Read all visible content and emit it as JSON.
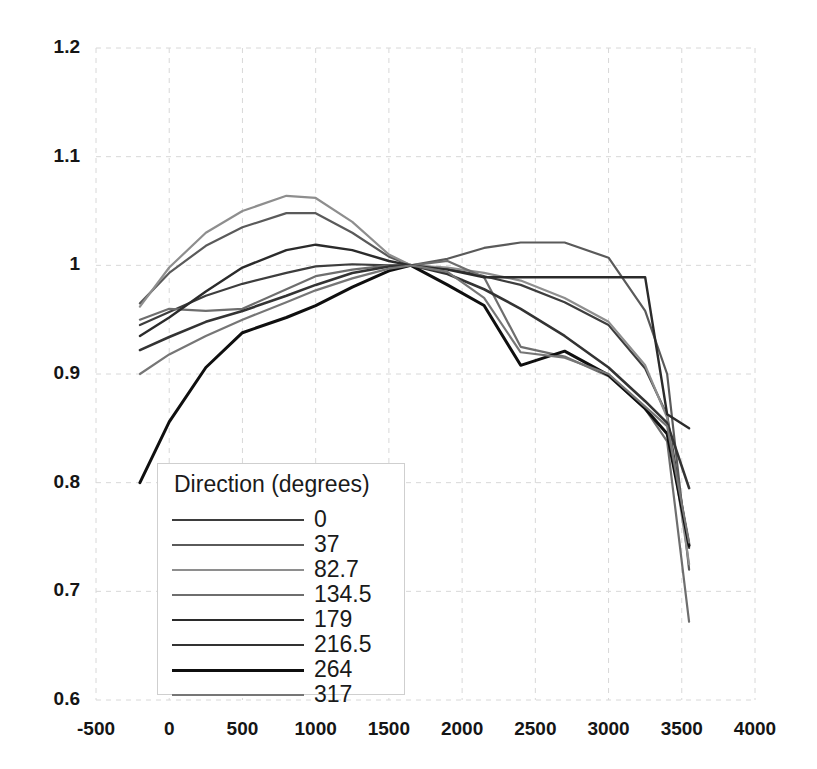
{
  "chart_data": {
    "type": "line",
    "title": "",
    "xlabel": "",
    "ylabel": "",
    "xlim": [
      -500,
      4000
    ],
    "ylim": [
      0.6,
      1.2
    ],
    "xticks": [
      "-500",
      "0",
      "500",
      "1000",
      "1500",
      "2000",
      "2500",
      "3000",
      "3500",
      "4000"
    ],
    "yticks": [
      "1.2",
      "1.1",
      "1",
      "0.9",
      "0.8",
      "0.7",
      "0.6"
    ],
    "grid": true,
    "legend_position": "lower-left",
    "legend_title": "Direction (degrees)",
    "series": [
      {
        "name": "0",
        "color": "#3d3d3d",
        "width": 2.2,
        "x": [
          -200,
          0,
          250,
          500,
          800,
          1000,
          1250,
          1500,
          1650,
          1900,
          2150,
          2400,
          2700,
          3000,
          3250,
          3400,
          3550
        ],
        "y": [
          0.945,
          0.957,
          0.972,
          0.983,
          0.993,
          0.999,
          1.001,
          1.0,
          1.0,
          0.997,
          0.99,
          0.982,
          0.966,
          0.945,
          0.905,
          0.862,
          0.74
        ]
      },
      {
        "name": "37",
        "color": "#5a5a5a",
        "width": 2.2,
        "x": [
          -200,
          0,
          250,
          500,
          800,
          1000,
          1250,
          1500,
          1650,
          1900,
          2150,
          2400,
          2700,
          3000,
          3250,
          3400,
          3550
        ],
        "y": [
          0.965,
          0.993,
          1.018,
          1.035,
          1.048,
          1.048,
          1.03,
          1.008,
          1.0,
          1.006,
          1.016,
          1.021,
          1.021,
          1.007,
          0.958,
          0.9,
          0.72
        ]
      },
      {
        "name": "82.7",
        "color": "#8e8e8e",
        "width": 2.2,
        "x": [
          -200,
          0,
          250,
          500,
          800,
          1000,
          1250,
          1500,
          1650,
          1900,
          2150,
          2400,
          2700,
          3000,
          3250,
          3400,
          3550
        ],
        "y": [
          0.962,
          0.998,
          1.03,
          1.05,
          1.064,
          1.062,
          1.04,
          1.01,
          1.0,
          0.998,
          0.993,
          0.986,
          0.97,
          0.948,
          0.908,
          0.86,
          0.725
        ]
      },
      {
        "name": "134.5",
        "color": "#6e6e6e",
        "width": 2.2,
        "x": [
          -200,
          0,
          250,
          500,
          800,
          1000,
          1250,
          1500,
          1650,
          1900,
          2150,
          2400,
          2700,
          3000,
          3250,
          3400,
          3550
        ],
        "y": [
          0.95,
          0.96,
          0.958,
          0.96,
          0.978,
          0.99,
          0.996,
          1.0,
          1.0,
          1.004,
          0.989,
          0.925,
          0.916,
          0.898,
          0.868,
          0.838,
          0.672
        ]
      },
      {
        "name": "179",
        "color": "#2b2b2b",
        "width": 2.4,
        "x": [
          -200,
          0,
          250,
          500,
          800,
          1000,
          1250,
          1500,
          1650,
          1900,
          2150,
          2400,
          2700,
          3000,
          3250,
          3400,
          3550
        ],
        "y": [
          0.935,
          0.952,
          0.976,
          0.998,
          1.014,
          1.019,
          1.014,
          1.004,
          1.0,
          0.996,
          0.989,
          0.989,
          0.989,
          0.989,
          0.989,
          0.863,
          0.85
        ]
      },
      {
        "name": "216.5",
        "color": "#333333",
        "width": 2.6,
        "x": [
          -200,
          0,
          250,
          500,
          800,
          1000,
          1250,
          1500,
          1650,
          1900,
          2150,
          2400,
          2700,
          3000,
          3250,
          3400,
          3550
        ],
        "y": [
          0.922,
          0.934,
          0.948,
          0.958,
          0.972,
          0.982,
          0.993,
          0.999,
          1.0,
          0.992,
          0.978,
          0.96,
          0.935,
          0.906,
          0.875,
          0.855,
          0.795
        ]
      },
      {
        "name": "264",
        "color": "#0f0f0f",
        "width": 3.0,
        "x": [
          -200,
          0,
          250,
          500,
          800,
          1000,
          1250,
          1500,
          1650,
          1900,
          2150,
          2400,
          2700,
          3000,
          3250,
          3400,
          3550
        ],
        "y": [
          0.8,
          0.856,
          0.906,
          0.938,
          0.952,
          0.963,
          0.98,
          0.995,
          1.0,
          0.982,
          0.963,
          0.908,
          0.921,
          0.899,
          0.868,
          0.845,
          0.742
        ]
      },
      {
        "name": "317",
        "color": "#767676",
        "width": 2.2,
        "x": [
          -200,
          0,
          250,
          500,
          800,
          1000,
          1250,
          1500,
          1650,
          1900,
          2150,
          2400,
          2700,
          3000,
          3250,
          3400,
          3550
        ],
        "y": [
          0.9,
          0.918,
          0.935,
          0.95,
          0.966,
          0.977,
          0.988,
          0.997,
          1.0,
          0.994,
          0.97,
          0.92,
          0.915,
          0.9,
          0.87,
          0.852,
          0.745
        ]
      }
    ]
  },
  "axes": {
    "y_labels": [
      "1.2",
      "1.1",
      "1",
      "0.9",
      "0.8",
      "0.7",
      "0.6"
    ],
    "x_labels": [
      "-500",
      "0",
      "500",
      "1000",
      "1500",
      "2000",
      "2500",
      "3000",
      "3500",
      "4000"
    ]
  },
  "legend": {
    "title": "Direction (degrees)",
    "items": [
      {
        "label": "0"
      },
      {
        "label": "37"
      },
      {
        "label": "82.7"
      },
      {
        "label": "134.5"
      },
      {
        "label": "179"
      },
      {
        "label": "216.5"
      },
      {
        "label": "264"
      },
      {
        "label": "317"
      }
    ]
  },
  "colors": {
    "grid": "#d8d8d8",
    "text": "#151515",
    "background": "#ffffff"
  }
}
